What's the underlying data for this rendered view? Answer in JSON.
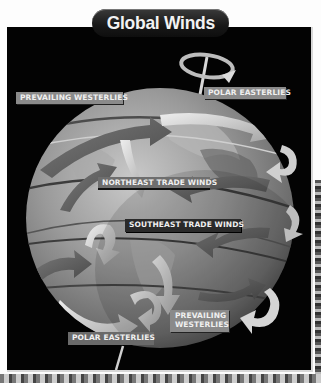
{
  "diagram": {
    "title": "Global Winds",
    "type": "Earth globe illustration with wind-belt arrows",
    "colors": {
      "panel_background": "#030303",
      "page_background": "#fdfdfd",
      "title_pill": "#1a1a1a",
      "title_text": "#f2f2f2",
      "label_background": "#8a8a8a",
      "label_text": "#f0f0f0",
      "globe_base": "#8c8c8c"
    },
    "labels": {
      "north_westerlies": "PREVAILING WESTERLIES",
      "north_polar_easterlies": "POLAR EASTERLIES",
      "northeast_trade_winds": "NORTHEAST TRADE WINDS",
      "southeast_trade_winds": "SOUTHEAST TRADE WINDS",
      "south_westerlies_line1": "PREVAILING",
      "south_westerlies_line2": "WESTERLIES",
      "south_polar_easterlies": "POLAR EASTERLIES"
    },
    "elements": {
      "globe": "earth-globe",
      "north_axis": "rotation-axis-north",
      "south_axis": "rotation-axis-south",
      "rotation_ring": "rotation-ring-arrow"
    }
  }
}
